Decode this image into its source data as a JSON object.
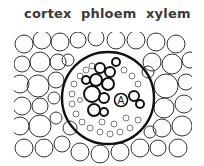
{
  "labels": {
    "cortex": "cortex",
    "phloem": "phloem",
    "xylem": "xylem"
  },
  "marker": {
    "letter": "A"
  },
  "colors": {
    "text": "#3a3a3a",
    "stroke": "#222222",
    "background": "#ffffff"
  }
}
